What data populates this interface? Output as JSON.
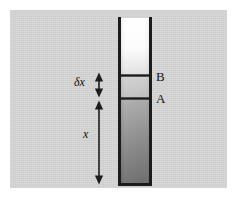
{
  "figure": {
    "kind": "physics-column-diagram",
    "page_background": "#ffffff",
    "panel_background": "#d4d4d4"
  },
  "column": {
    "name": "fluid-column",
    "wall_color": "#1c1c1c",
    "wall_thickness_px": 3,
    "left_px": 118,
    "right_px": 152,
    "top_px": 18,
    "bottom_px": 185,
    "open_top": true,
    "closed_bottom": true,
    "sections": [
      {
        "name": "upper-section",
        "label": "",
        "top_px": 18,
        "bottom_px": 75,
        "fill_top": "#ffffff",
        "fill_bottom": "#e2e2e2"
      },
      {
        "name": "slab-section",
        "label": "",
        "top_px": 75,
        "bottom_px": 98,
        "fill_top": "#cfcfcf",
        "fill_bottom": "#c2c2c2"
      },
      {
        "name": "lower-section",
        "label": "",
        "top_px": 98,
        "bottom_px": 185,
        "fill_top": "#a9a9a9",
        "fill_bottom": "#6f6f6f"
      }
    ],
    "dividers": [
      {
        "name": "divider-B",
        "y_px": 75,
        "color": "#1c1c1c"
      },
      {
        "name": "divider-A",
        "y_px": 98,
        "color": "#1c1c1c"
      }
    ]
  },
  "labels": {
    "level_b": "B",
    "level_a": "A",
    "slab_thickness": "δx",
    "depth": "x"
  },
  "arrows": [
    {
      "name": "delta-x-arrow",
      "label": "δx",
      "x_px": 99,
      "y_top_px": 73,
      "y_bottom_px": 97,
      "double_headed": true,
      "color": "#1c1c1c"
    },
    {
      "name": "x-arrow",
      "label": "x",
      "x_px": 99,
      "y_top_px": 101,
      "y_bottom_px": 184,
      "double_headed": true,
      "color": "#1c1c1c"
    }
  ]
}
